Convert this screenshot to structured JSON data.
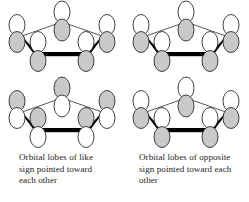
{
  "figure": {
    "top_cropped_text": "",
    "colors": {
      "lobe_shaded": "#c9c9c9",
      "lobe_white": "#ffffff",
      "lobe_stroke": "#222222",
      "bond_thin": "#111111",
      "bond_thick": "#000000",
      "background": "#ffffff",
      "caption_text": "#1d1d1d"
    },
    "layout": {
      "rows": 2,
      "columns": 2,
      "grid_description": "Two columns of stacked ring-orbital diagrams with a caption beneath each column"
    }
  },
  "diagrams": [
    {
      "id": "top-left",
      "position": "row 1, column 1",
      "ring": "five-membered ring skeleton",
      "bond_bottom": "thick black bond between the two lower ring vertices",
      "lobe_signs": {
        "apex": "lower lobe shaded",
        "upper_left": "lower lobe shaded",
        "upper_right": "lower lobe shaded",
        "lower_left": "lower lobe shaded",
        "lower_right": "lower lobe shaded"
      }
    },
    {
      "id": "top-right",
      "position": "row 1, column 2",
      "ring": "five-membered ring skeleton",
      "bond_bottom": "thick black bond between the two lower ring vertices",
      "lobe_signs": {
        "apex": "lower lobe shaded",
        "upper_left": "lower lobe shaded",
        "upper_right": "lower lobe shaded",
        "lower_left": "lower lobe shaded",
        "lower_right": "lower lobe shaded"
      }
    },
    {
      "id": "bottom-left",
      "position": "row 2, column 1",
      "ring": "five-membered ring skeleton",
      "bond_bottom": "thick black bond between the two lower ring vertices",
      "lobe_signs": {
        "apex": "upper lobe shaded",
        "upper_left": "upper lobe shaded",
        "upper_right": "upper lobe shaded",
        "lower_left": "upper lobe shaded",
        "lower_right": "upper lobe shaded"
      }
    },
    {
      "id": "bottom-right",
      "position": "row 2, column 2",
      "ring": "five-membered ring skeleton",
      "bond_bottom": "thick black bond between the two lower ring vertices",
      "lobe_signs": {
        "apex": "upper lobe shaded",
        "upper_left": "upper lobe shaded",
        "upper_right": "upper lobe shaded",
        "lower_left": "lower lobe shaded",
        "lower_right": "lower lobe shaded"
      }
    }
  ],
  "captions": {
    "left": {
      "line1": "Orbital lobes of like",
      "line2": "sign pointed toward",
      "line3": "each other"
    },
    "right": {
      "line1": "Orbital lobes of opposite",
      "line2": "sign pointed toward each",
      "line3": "other"
    }
  }
}
